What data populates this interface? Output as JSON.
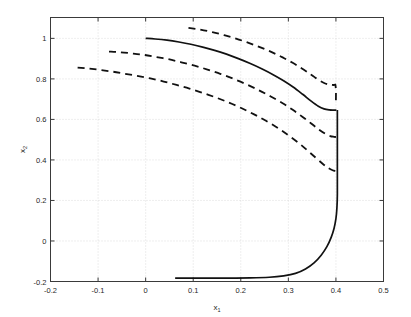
{
  "chart_data": {
    "type": "line",
    "title": "",
    "xlabel": "x_1",
    "ylabel": "x_2",
    "xlabel_base": "x",
    "xlabel_sub": "1",
    "ylabel_base": "x",
    "ylabel_sub": "2",
    "xlim": [
      -0.2,
      0.5
    ],
    "ylim": [
      -0.2,
      1.103
    ],
    "grid": true,
    "legend": "none",
    "xticks": [
      -0.2,
      -0.1,
      0,
      0.1,
      0.2,
      0.3,
      0.4,
      0.5
    ],
    "xticklabels": [
      "-0.2",
      "-0.1",
      "0",
      "0.1",
      "0.2",
      "0.3",
      "0.4",
      "0.5"
    ],
    "yticks": [
      -0.2,
      0,
      0.2,
      0.4,
      0.6,
      0.8,
      1
    ],
    "yticklabels": [
      "-0.2",
      "0",
      "0.2",
      "0.4",
      "0.6",
      "0.8",
      "1"
    ],
    "series": [
      {
        "name": "nominal-boundary-upper",
        "style": "solid",
        "points": [
          [
            0.0,
            1.0
          ],
          [
            0.02,
            0.997
          ],
          [
            0.045,
            0.991
          ],
          [
            0.07,
            0.982
          ],
          [
            0.095,
            0.971
          ],
          [
            0.12,
            0.957
          ],
          [
            0.145,
            0.941
          ],
          [
            0.17,
            0.922
          ],
          [
            0.195,
            0.9
          ],
          [
            0.22,
            0.876
          ],
          [
            0.245,
            0.849
          ],
          [
            0.268,
            0.821
          ],
          [
            0.29,
            0.791
          ],
          [
            0.31,
            0.76
          ],
          [
            0.33,
            0.724
          ],
          [
            0.348,
            0.69
          ],
          [
            0.363,
            0.665
          ],
          [
            0.375,
            0.652
          ],
          [
            0.386,
            0.647
          ],
          [
            0.395,
            0.646
          ],
          [
            0.401,
            0.646
          ]
        ]
      },
      {
        "name": "nominal-boundary-turn",
        "style": "solid",
        "points": [
          [
            0.403,
            0.646
          ],
          [
            0.403,
            0.4
          ],
          [
            0.403,
            0.23
          ],
          [
            0.402,
            0.16
          ],
          [
            0.4,
            0.11
          ],
          [
            0.396,
            0.062
          ],
          [
            0.39,
            0.018
          ],
          [
            0.381,
            -0.028
          ],
          [
            0.369,
            -0.07
          ],
          [
            0.354,
            -0.108
          ],
          [
            0.336,
            -0.138
          ],
          [
            0.315,
            -0.16
          ],
          [
            0.29,
            -0.172
          ],
          [
            0.26,
            -0.179
          ],
          [
            0.22,
            -0.182
          ],
          [
            0.17,
            -0.183
          ],
          [
            0.12,
            -0.183
          ],
          [
            0.085,
            -0.183
          ],
          [
            0.062,
            -0.183
          ]
        ]
      },
      {
        "name": "perturbed-boundary-outer",
        "style": "dashed",
        "points": [
          [
            0.09,
            1.052
          ],
          [
            0.115,
            1.043
          ],
          [
            0.14,
            1.031
          ],
          [
            0.165,
            1.016
          ],
          [
            0.19,
            0.999
          ],
          [
            0.215,
            0.979
          ],
          [
            0.24,
            0.957
          ],
          [
            0.265,
            0.932
          ],
          [
            0.288,
            0.906
          ],
          [
            0.31,
            0.878
          ],
          [
            0.33,
            0.849
          ],
          [
            0.348,
            0.821
          ],
          [
            0.362,
            0.797
          ],
          [
            0.374,
            0.781
          ],
          [
            0.384,
            0.773
          ],
          [
            0.392,
            0.77
          ],
          [
            0.397,
            0.77
          ],
          [
            0.399,
            0.77
          ],
          [
            0.4,
            0.74
          ],
          [
            0.4,
            0.7
          ],
          [
            0.4,
            0.67
          ]
        ]
      },
      {
        "name": "perturbed-boundary-middle",
        "style": "dashed",
        "points": [
          [
            -0.077,
            0.935
          ],
          [
            -0.055,
            0.932
          ],
          [
            -0.03,
            0.926
          ],
          [
            -0.005,
            0.919
          ],
          [
            0.02,
            0.909
          ],
          [
            0.048,
            0.897
          ],
          [
            0.075,
            0.882
          ],
          [
            0.103,
            0.865
          ],
          [
            0.13,
            0.846
          ],
          [
            0.158,
            0.824
          ],
          [
            0.185,
            0.8
          ],
          [
            0.212,
            0.773
          ],
          [
            0.238,
            0.744
          ],
          [
            0.263,
            0.713
          ],
          [
            0.288,
            0.68
          ],
          [
            0.31,
            0.646
          ],
          [
            0.33,
            0.612
          ],
          [
            0.348,
            0.58
          ],
          [
            0.363,
            0.552
          ],
          [
            0.377,
            0.53
          ],
          [
            0.388,
            0.518
          ],
          [
            0.396,
            0.514
          ],
          [
            0.4,
            0.513
          ]
        ]
      },
      {
        "name": "perturbed-boundary-inner",
        "style": "dashed",
        "points": [
          [
            -0.143,
            0.856
          ],
          [
            -0.12,
            0.851
          ],
          [
            -0.095,
            0.844
          ],
          [
            -0.07,
            0.836
          ],
          [
            -0.045,
            0.826
          ],
          [
            -0.018,
            0.815
          ],
          [
            0.01,
            0.802
          ],
          [
            0.038,
            0.787
          ],
          [
            0.065,
            0.77
          ],
          [
            0.092,
            0.752
          ],
          [
            0.12,
            0.731
          ],
          [
            0.148,
            0.708
          ],
          [
            0.175,
            0.683
          ],
          [
            0.202,
            0.655
          ],
          [
            0.228,
            0.625
          ],
          [
            0.253,
            0.593
          ],
          [
            0.278,
            0.558
          ],
          [
            0.3,
            0.522
          ],
          [
            0.322,
            0.483
          ],
          [
            0.34,
            0.447
          ],
          [
            0.357,
            0.412
          ],
          [
            0.372,
            0.381
          ],
          [
            0.384,
            0.36
          ],
          [
            0.393,
            0.349
          ],
          [
            0.399,
            0.345
          ]
        ]
      }
    ]
  },
  "axis": {
    "x_label_text": "x",
    "x_label_sub": "1",
    "y_label_text": "x",
    "y_label_sub": "2"
  }
}
